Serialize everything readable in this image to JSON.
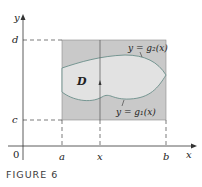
{
  "figure": {
    "caption": "FIGURE 6",
    "axes": {
      "x_label": "x",
      "y_label": "y",
      "origin_label": "0"
    },
    "x_ticks": [
      "a",
      "x",
      "b"
    ],
    "y_ticks": [
      "d",
      "c"
    ],
    "region_label": "D",
    "upper_curve_label": "y = g₂(x)",
    "lower_curve_label": "y = g₁(x)",
    "colors": {
      "rectangle": "#c9c9c9",
      "region": "#e2e2e2",
      "curve": "#6b8f8a",
      "axis": "#333333"
    }
  }
}
